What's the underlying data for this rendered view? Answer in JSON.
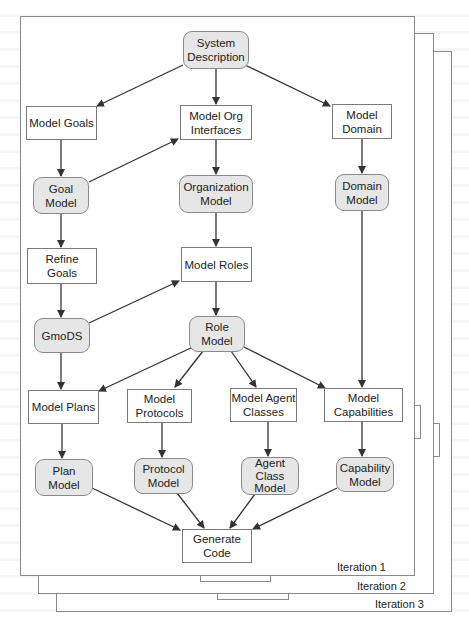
{
  "diagram": {
    "colors": {
      "frame_border": "#8a8a8a",
      "task_fill": "#ffffff",
      "model_fill": "#e6e6e6",
      "edge": "#333333"
    },
    "iterations": [
      {
        "label": "Iteration 1"
      },
      {
        "label": "Iteration 2"
      },
      {
        "label": "Iteration 3"
      }
    ],
    "nodes": {
      "system_description": {
        "label": "System\nDescription",
        "kind": "model"
      },
      "model_goals": {
        "label": "Model Goals",
        "kind": "task"
      },
      "model_org_interfaces": {
        "label": "Model Org\nInterfaces",
        "kind": "task"
      },
      "model_domain": {
        "label": "Model\nDomain",
        "kind": "task"
      },
      "goal_model": {
        "label": "Goal\nModel",
        "kind": "model"
      },
      "organization_model": {
        "label": "Organization\nModel",
        "kind": "model"
      },
      "domain_model": {
        "label": "Domain\nModel",
        "kind": "model"
      },
      "refine_goals": {
        "label": "Refine\nGoals",
        "kind": "task"
      },
      "model_roles": {
        "label": "Model Roles",
        "kind": "task"
      },
      "gmods": {
        "label": "GmoDS",
        "kind": "model"
      },
      "role_model": {
        "label": "Role\nModel",
        "kind": "model"
      },
      "model_plans": {
        "label": "Model Plans",
        "kind": "task"
      },
      "model_protocols": {
        "label": "Model\nProtocols",
        "kind": "task"
      },
      "model_agent_classes": {
        "label": "Model Agent\nClasses",
        "kind": "task"
      },
      "model_capabilities": {
        "label": "Model\nCapabilities",
        "kind": "task"
      },
      "plan_model": {
        "label": "Plan\nModel",
        "kind": "model"
      },
      "protocol_model": {
        "label": "Protocol\nModel",
        "kind": "model"
      },
      "agent_class_model": {
        "label": "Agent\nClass\nModel",
        "kind": "model"
      },
      "capability_model": {
        "label": "Capability\nModel",
        "kind": "model"
      },
      "generate_code": {
        "label": "Generate\nCode",
        "kind": "task"
      }
    },
    "edges": [
      [
        "System Description",
        "Model Goals"
      ],
      [
        "System Description",
        "Model Org Interfaces"
      ],
      [
        "System Description",
        "Model Domain"
      ],
      [
        "Model Goals",
        "Goal Model"
      ],
      [
        "Goal Model",
        "Model Org Interfaces"
      ],
      [
        "Model Org Interfaces",
        "Organization Model"
      ],
      [
        "Model Domain",
        "Domain Model"
      ],
      [
        "Goal Model",
        "Refine Goals"
      ],
      [
        "Organization Model",
        "Model Roles"
      ],
      [
        "Refine Goals",
        "GmoDS"
      ],
      [
        "GmoDS",
        "Model Roles"
      ],
      [
        "Model Roles",
        "Role Model"
      ],
      [
        "GmoDS",
        "Model Plans"
      ],
      [
        "Role Model",
        "Model Plans"
      ],
      [
        "Role Model",
        "Model Protocols"
      ],
      [
        "Role Model",
        "Model Agent Classes"
      ],
      [
        "Role Model",
        "Model Capabilities"
      ],
      [
        "Domain Model",
        "Model Capabilities"
      ],
      [
        "Model Plans",
        "Plan Model"
      ],
      [
        "Model Protocols",
        "Protocol Model"
      ],
      [
        "Model Agent Classes",
        "Agent Class Model"
      ],
      [
        "Model Capabilities",
        "Capability Model"
      ],
      [
        "Plan Model",
        "Generate Code"
      ],
      [
        "Protocol Model",
        "Generate Code"
      ],
      [
        "Agent Class Model",
        "Generate Code"
      ],
      [
        "Capability Model",
        "Generate Code"
      ]
    ]
  }
}
